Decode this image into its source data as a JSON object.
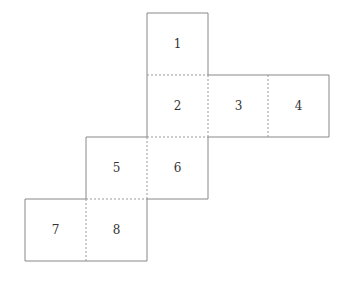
{
  "diagram": {
    "type": "cube-net",
    "stroke_color": "#888888",
    "squares": [
      {
        "label": "1",
        "col": 2,
        "row": 0
      },
      {
        "label": "2",
        "col": 2,
        "row": 1
      },
      {
        "label": "3",
        "col": 3,
        "row": 1
      },
      {
        "label": "4",
        "col": 4,
        "row": 1
      },
      {
        "label": "5",
        "col": 1,
        "row": 2
      },
      {
        "label": "6",
        "col": 2,
        "row": 2
      },
      {
        "label": "7",
        "col": 0,
        "row": 3
      },
      {
        "label": "8",
        "col": 1,
        "row": 3
      }
    ]
  }
}
